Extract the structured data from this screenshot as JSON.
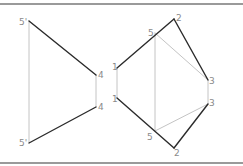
{
  "diagram": {
    "colors": {
      "border": "#9a9a9a",
      "dark_line": "#2b2b2b",
      "light_line": "#c4c4c4",
      "label": "#8a8a8a"
    },
    "points": {
      "p5prime_top": {
        "label": "5'",
        "x": 29,
        "y": 21
      },
      "p5prime_bot": {
        "label": "5'",
        "x": 29,
        "y": 143
      },
      "p4_top": {
        "label": "4",
        "x": 96,
        "y": 75
      },
      "p4_bot": {
        "label": "4",
        "x": 96,
        "y": 107
      },
      "p1_top": {
        "label": "1",
        "x": 117,
        "y": 68
      },
      "p1_bot": {
        "label": "1",
        "x": 117,
        "y": 98
      },
      "p5_top": {
        "label": "5",
        "x": 155,
        "y": 33
      },
      "p5_bot": {
        "label": "5",
        "x": 155,
        "y": 131
      },
      "p2_top": {
        "label": "2",
        "x": 174,
        "y": 19
      },
      "p2_bot": {
        "label": "2",
        "x": 174,
        "y": 148
      },
      "p3_top": {
        "label": "3",
        "x": 208,
        "y": 80
      },
      "p3_bot": {
        "label": "3",
        "x": 208,
        "y": 104
      }
    },
    "labels": [
      {
        "id": "lbl-5prime-top",
        "text": "5'",
        "x": 19,
        "y": 25
      },
      {
        "id": "lbl-5prime-bot",
        "text": "5'",
        "x": 19,
        "y": 146
      },
      {
        "id": "lbl-4-top",
        "text": "4",
        "x": 98,
        "y": 78
      },
      {
        "id": "lbl-4-bot",
        "text": "4",
        "x": 98,
        "y": 110
      },
      {
        "id": "lbl-1-top",
        "text": "1",
        "x": 112,
        "y": 70
      },
      {
        "id": "lbl-1-bot",
        "text": "1",
        "x": 112,
        "y": 102
      },
      {
        "id": "lbl-5-top",
        "text": "5",
        "x": 148,
        "y": 36
      },
      {
        "id": "lbl-5-bot",
        "text": "5",
        "x": 147,
        "y": 140
      },
      {
        "id": "lbl-2-top",
        "text": "2",
        "x": 176,
        "y": 21
      },
      {
        "id": "lbl-2-bot",
        "text": "2",
        "x": 174,
        "y": 156
      },
      {
        "id": "lbl-3-top",
        "text": "3",
        "x": 209,
        "y": 84
      },
      {
        "id": "lbl-3-bot",
        "text": "3",
        "x": 209,
        "y": 106
      }
    ],
    "dark_edges": [
      [
        "p5prime_top",
        "p4_top"
      ],
      [
        "p5prime_bot",
        "p4_bot"
      ],
      [
        "p1_top",
        "p2_top"
      ],
      [
        "p2_top",
        "p3_top"
      ],
      [
        "p1_bot",
        "p2_bot"
      ],
      [
        "p2_bot",
        "p3_bot"
      ]
    ],
    "light_edges": [
      [
        "p5prime_top",
        "p5prime_bot"
      ],
      [
        "p4_top",
        "p4_bot"
      ],
      [
        "p1_top",
        "p1_bot"
      ],
      [
        "p5_top",
        "p5_bot"
      ],
      [
        "p3_top",
        "p3_bot"
      ],
      [
        "p5_top",
        "p3_top"
      ],
      [
        "p5_bot",
        "p3_bot"
      ]
    ]
  }
}
